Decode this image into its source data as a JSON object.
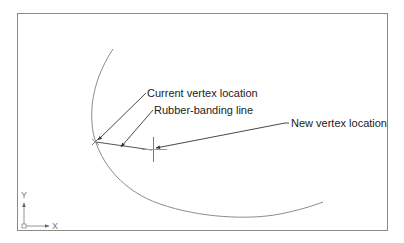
{
  "diagram": {
    "labels": {
      "current_vertex": "Current vertex location",
      "rubber_band": "Rubber-banding line",
      "new_vertex": "New vertex location"
    },
    "ucs": {
      "x_label": "X",
      "y_label": "Y"
    },
    "colors": {
      "frame": "#8a8a8a",
      "curve": "#8c8c8c",
      "leader": "#333333",
      "text": "#222222"
    }
  }
}
